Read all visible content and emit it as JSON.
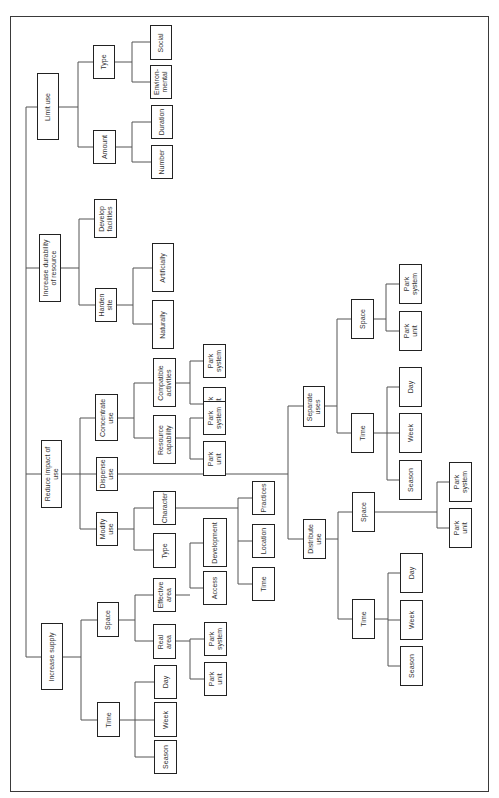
{
  "diagram": {
    "title": "",
    "orientation": "rotated-90-ccw",
    "root_children": [
      "Limit use",
      "Increase durability of resource",
      "Reduce impact of use",
      "Increase supply"
    ],
    "nodes": {
      "limit_use": "Limit use",
      "limit_type": "Type",
      "limit_social": "Social",
      "limit_environmental": "Environ-\nmental",
      "limit_amount": "Amount",
      "limit_duration": "Duration",
      "limit_number": "Number",
      "durability": "Increase durability\nof resource",
      "develop_facilities": "Develop\nfacilities",
      "harden_site": "Harden\nsite",
      "artificially": "Artificially",
      "naturally": "Naturally",
      "reduce_impact": "Reduce impact of\nuse",
      "concentrate_use": "Concentrate\nuse",
      "compatible_activities": "Compatible\nactivities",
      "ca_park_system": "Park\nsystem",
      "ca_park_unit": "Park\nunit",
      "resource_capability": "Resource\ncapability",
      "rc_park_system": "Park\nsystem",
      "rc_park_unit": "Park\nunit",
      "dispense_use": "Dispense\nuse",
      "separate_uses": "Separate\nuses",
      "sep_space": "Space",
      "sep_park_system": "Park\nsystem",
      "sep_park_unit": "Park\nunit",
      "sep_time": "Time",
      "sep_day": "Day",
      "sep_week": "Week",
      "sep_season": "Season",
      "distribute_use": "Distribute\nuse",
      "dist_space": "Space",
      "dist_park_system": "Park\nsystem",
      "dist_park_unit": "Park\nunit",
      "dist_time": "Time",
      "dist_day": "Day",
      "dist_week": "Week",
      "dist_season": "Season",
      "modify_use": "Modify\nuse",
      "character": "Character",
      "practices": "Practices",
      "location": "Location",
      "char_time": "Time",
      "modify_type": "Type",
      "increase_supply": "Increase supply",
      "supply_space": "Space",
      "effective_area": "Effective\narea",
      "development": "Development",
      "access": "Access",
      "real_area": "Real\narea",
      "ra_park_system": "Park\nsystem",
      "ra_park_unit": "Park\nunit",
      "supply_time": "Time",
      "supply_day": "Day",
      "supply_week": "Week",
      "supply_season": "Season"
    },
    "colors": {
      "box_border": "#222222",
      "line": "#555555",
      "background": "#ffffff"
    }
  }
}
